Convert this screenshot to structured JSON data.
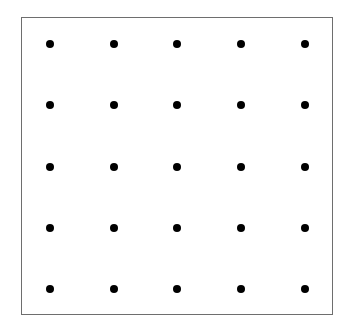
{
  "diagram": {
    "type": "dot-grid",
    "rows": 5,
    "columns": 5,
    "dot_color": "#000000",
    "border_color": "#6e6e6e",
    "column_positions": [
      50,
      114,
      177,
      241,
      305
    ],
    "row_positions": [
      44,
      105,
      167,
      228,
      289
    ]
  }
}
